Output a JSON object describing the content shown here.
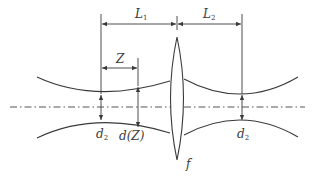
{
  "diagram": {
    "colors": {
      "background": "#ffffff",
      "stroke": "#3a3a3a",
      "axis": "#555555"
    },
    "labels": {
      "L1": {
        "main": "L",
        "sub": "1"
      },
      "L2": {
        "main": "L",
        "sub": "2"
      },
      "Z": {
        "main": "Z"
      },
      "d2_left": {
        "main": "d",
        "sub": "2"
      },
      "dZ": {
        "main": "d(Z)"
      },
      "d2_right": {
        "main": "d",
        "sub": "2"
      },
      "f": {
        "main": "f"
      }
    },
    "elements": [
      "optical-axis (dash-dot line)",
      "thin convex lens with focal length f",
      "input beam envelope with waist d2",
      "output beam envelope with waist d2",
      "dimension L1 (input waist to lens)",
      "dimension L2 (lens to output waist)",
      "dimension Z (input waist to plane of diameter d(Z))"
    ]
  }
}
